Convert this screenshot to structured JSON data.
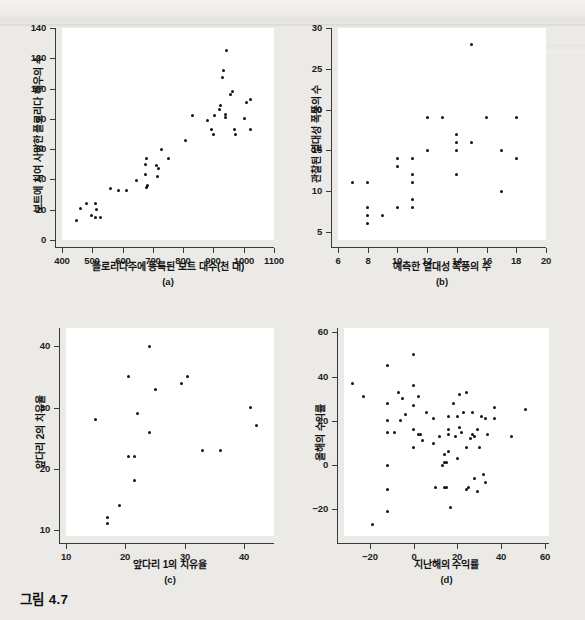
{
  "figure": {
    "caption": "그림 4.7"
  },
  "chart_data": [
    {
      "id": "a",
      "type": "scatter",
      "panel_label": "(a)",
      "title": "",
      "xlabel": "플로리다주에 등록된 보트 대수(천 대)",
      "ylabel": "보트에 치여 사망한 플로리다 해우의 수",
      "xlim": [
        400,
        1100
      ],
      "ylim": [
        0,
        140
      ],
      "xticks": [
        400,
        500,
        600,
        700,
        800,
        900,
        1000,
        1100
      ],
      "yticks": [
        0,
        20,
        40,
        60,
        80,
        100,
        120,
        140
      ],
      "grid": false,
      "legend": "none",
      "points": [
        [
          447,
          13
        ],
        [
          460,
          21
        ],
        [
          481,
          24
        ],
        [
          498,
          16
        ],
        [
          512,
          24
        ],
        [
          513,
          20
        ],
        [
          512,
          15
        ],
        [
          526,
          15
        ],
        [
          559,
          34
        ],
        [
          585,
          33
        ],
        [
          614,
          33
        ],
        [
          645,
          39
        ],
        [
          675,
          43
        ],
        [
          675,
          50
        ],
        [
          681,
          36
        ],
        [
          679,
          35
        ],
        [
          678,
          54
        ],
        [
          712,
          49
        ],
        [
          716,
          42
        ],
        [
          717,
          47
        ],
        [
          730,
          60
        ],
        [
          751,
          54
        ],
        [
          809,
          66
        ],
        [
          830,
          82
        ],
        [
          880,
          79
        ],
        [
          894,
          73
        ],
        [
          900,
          70
        ],
        [
          905,
          82
        ],
        [
          921,
          86
        ],
        [
          924,
          89
        ],
        [
          929,
          107
        ],
        [
          933,
          112
        ],
        [
          939,
          83
        ],
        [
          940,
          81
        ],
        [
          943,
          125
        ],
        [
          956,
          96
        ],
        [
          962,
          98
        ],
        [
          969,
          73
        ],
        [
          972,
          70
        ],
        [
          1002,
          80
        ],
        [
          1008,
          91
        ],
        [
          1023,
          93
        ],
        [
          1021,
          73
        ]
      ]
    },
    {
      "id": "b",
      "type": "scatter",
      "panel_label": "(b)",
      "title": "",
      "xlabel": "예측한 열대성 폭풍의 수",
      "ylabel": "관찰된 열대성 폭풍의 수",
      "xlim": [
        6,
        20
      ],
      "ylim": [
        4,
        30
      ],
      "xticks": [
        6,
        8,
        10,
        12,
        14,
        16,
        18,
        20
      ],
      "yticks": [
        5,
        10,
        15,
        20,
        25,
        30
      ],
      "grid": false,
      "legend": "none",
      "points": [
        [
          7,
          11
        ],
        [
          8,
          11
        ],
        [
          8,
          8
        ],
        [
          8,
          7
        ],
        [
          8,
          6
        ],
        [
          9,
          7
        ],
        [
          10,
          14
        ],
        [
          10,
          13
        ],
        [
          10,
          8
        ],
        [
          11,
          14
        ],
        [
          11,
          12
        ],
        [
          11,
          11
        ],
        [
          11,
          9
        ],
        [
          11,
          8
        ],
        [
          12,
          19
        ],
        [
          12,
          15
        ],
        [
          13,
          19
        ],
        [
          14,
          17
        ],
        [
          14,
          16
        ],
        [
          14,
          15
        ],
        [
          14,
          12
        ],
        [
          15,
          28
        ],
        [
          15,
          16
        ],
        [
          16,
          19
        ],
        [
          17,
          15
        ],
        [
          17,
          10
        ],
        [
          18,
          19
        ],
        [
          18,
          14
        ]
      ]
    },
    {
      "id": "c",
      "type": "scatter",
      "panel_label": "(c)",
      "title": "",
      "xlabel": "앞다리 1의 치유율",
      "ylabel": "앞다리 2의 치유율",
      "xlim": [
        10,
        45
      ],
      "ylim": [
        9,
        43
      ],
      "xticks": [
        10,
        20,
        30,
        40
      ],
      "yticks": [
        10,
        20,
        30,
        40
      ],
      "grid": false,
      "legend": "none",
      "points": [
        [
          15,
          28
        ],
        [
          17,
          12
        ],
        [
          17,
          11
        ],
        [
          19,
          14
        ],
        [
          20.5,
          35
        ],
        [
          20.5,
          22
        ],
        [
          21.5,
          22
        ],
        [
          21.5,
          18
        ],
        [
          22,
          29
        ],
        [
          24,
          40
        ],
        [
          24,
          26
        ],
        [
          25,
          33
        ],
        [
          29.5,
          34
        ],
        [
          30.5,
          35
        ],
        [
          33,
          23
        ],
        [
          36,
          23
        ],
        [
          41,
          30
        ],
        [
          42,
          27
        ]
      ]
    },
    {
      "id": "d",
      "type": "scatter",
      "panel_label": "(d)",
      "title": "",
      "xlabel": "지난해의 수익률",
      "ylabel": "올해의 수익률",
      "xlim": [
        -32,
        62
      ],
      "ylim": [
        -32,
        62
      ],
      "xticks": [
        -20,
        0,
        20,
        40,
        60
      ],
      "yticks": [
        -20,
        0,
        20,
        40,
        60
      ],
      "grid": false,
      "legend": "none",
      "points": [
        [
          -28,
          37
        ],
        [
          -23,
          31
        ],
        [
          -19,
          -27
        ],
        [
          -12,
          45
        ],
        [
          -12,
          28
        ],
        [
          -12,
          20
        ],
        [
          -12,
          15
        ],
        [
          -12,
          0
        ],
        [
          -12,
          -11
        ],
        [
          -12,
          -21
        ],
        [
          -9,
          15
        ],
        [
          -7,
          33
        ],
        [
          -6,
          20
        ],
        [
          -5,
          30
        ],
        [
          -4,
          23
        ],
        [
          0,
          50
        ],
        [
          0,
          36
        ],
        [
          0,
          27
        ],
        [
          0,
          16
        ],
        [
          0,
          8
        ],
        [
          2,
          31
        ],
        [
          2,
          14
        ],
        [
          3,
          14
        ],
        [
          4,
          11
        ],
        [
          6,
          24
        ],
        [
          9,
          21
        ],
        [
          9,
          10
        ],
        [
          10,
          -10
        ],
        [
          12,
          13
        ],
        [
          13,
          0
        ],
        [
          14,
          5
        ],
        [
          14,
          1
        ],
        [
          14,
          -10
        ],
        [
          15,
          1
        ],
        [
          15,
          -10
        ],
        [
          16,
          16
        ],
        [
          16,
          14
        ],
        [
          16,
          22
        ],
        [
          16,
          6
        ],
        [
          17,
          -19
        ],
        [
          18,
          28
        ],
        [
          19,
          13
        ],
        [
          20,
          3
        ],
        [
          20,
          22
        ],
        [
          21,
          32
        ],
        [
          21,
          17
        ],
        [
          22,
          15
        ],
        [
          23,
          24
        ],
        [
          24,
          33
        ],
        [
          24,
          8
        ],
        [
          24,
          -11
        ],
        [
          25,
          -10
        ],
        [
          26,
          12
        ],
        [
          27,
          24
        ],
        [
          27,
          14
        ],
        [
          28,
          13
        ],
        [
          28,
          -6
        ],
        [
          29,
          16
        ],
        [
          29,
          -12
        ],
        [
          30,
          8
        ],
        [
          31,
          22
        ],
        [
          32,
          -4
        ],
        [
          33,
          21
        ],
        [
          33,
          -8
        ],
        [
          34,
          14
        ],
        [
          37,
          26
        ],
        [
          37,
          21
        ],
        [
          45,
          13
        ],
        [
          51,
          25
        ]
      ]
    }
  ]
}
